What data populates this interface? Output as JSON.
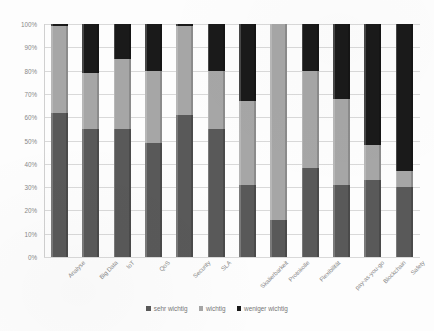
{
  "chart_data": {
    "type": "bar",
    "title": "",
    "subtitle": "",
    "xlabel": "",
    "ylabel": "",
    "stacked": true,
    "stack_mode": "percent",
    "grid": true,
    "legend_position": "bottom",
    "ylim": [
      0,
      100
    ],
    "yticks": [
      "0%",
      "10%",
      "20%",
      "30%",
      "40%",
      "50%",
      "60%",
      "70%",
      "80%",
      "90%",
      "100%"
    ],
    "ytick_values": [
      0,
      10,
      20,
      30,
      40,
      50,
      60,
      70,
      80,
      90,
      100
    ],
    "categories": [
      "Analyse",
      "Big Data",
      "IoT",
      "QoS",
      "Security",
      "SLA",
      "Skalierbarkeit",
      "Protokolle",
      "Flexibilität",
      "pay-as-you-go",
      "Blockchain",
      "Safety"
    ],
    "series": [
      {
        "name": "sehr wichtig",
        "color": "#595959",
        "values": [
          62,
          55,
          55,
          49,
          61,
          55,
          31,
          16,
          38,
          31,
          33,
          30
        ]
      },
      {
        "name": "wichtig",
        "color": "#a6a6a6",
        "values": [
          37,
          24,
          30,
          31,
          38,
          25,
          36,
          84,
          42,
          37,
          15,
          7
        ]
      },
      {
        "name": "weniger wichtig",
        "color": "#1a1a1a",
        "values": [
          1,
          21,
          15,
          20,
          1,
          20,
          33,
          0,
          20,
          32,
          52,
          63
        ]
      }
    ]
  },
  "legend": {
    "items": [
      {
        "label": "sehr wichtig",
        "color": "#595959"
      },
      {
        "label": "wichtig",
        "color": "#a6a6a6"
      },
      {
        "label": "weniger wichtig",
        "color": "#1a1a1a"
      }
    ]
  }
}
